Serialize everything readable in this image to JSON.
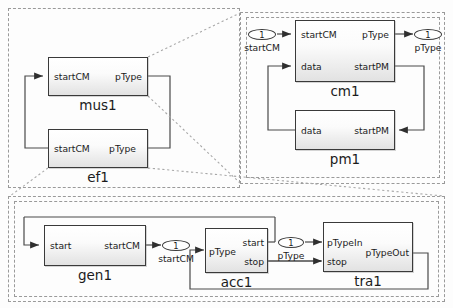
{
  "diagram": {
    "containers": [
      {
        "id": "outer-top",
        "name": "outer-top-container"
      },
      {
        "id": "detail-right",
        "name": "detail-right-container"
      },
      {
        "id": "outer-bottom",
        "name": "outer-bottom-container"
      }
    ]
  },
  "blocks": {
    "mus1": {
      "name": "mus1",
      "in_port": "startCM",
      "out_port": "pType"
    },
    "ef1": {
      "name": "ef1",
      "in_port": "startCM",
      "out_port": "pType"
    },
    "cm1": {
      "name": "cm1",
      "in_port_1": "startCM",
      "in_port_2": "data",
      "out_port_1": "pType",
      "out_port_2": "startPM"
    },
    "pm1": {
      "name": "pm1",
      "in_port_1": "data",
      "out_port_1": "startPM"
    },
    "gen1": {
      "name": "gen1",
      "in_port": "start",
      "out_port": "startCM"
    },
    "acc1": {
      "name": "acc1",
      "in_port": "pType",
      "out_port_1": "start",
      "out_port_2": "stop"
    },
    "tra1": {
      "name": "tra1",
      "in_port_1": "pTypeIn",
      "in_port_2": "stop",
      "out_port_1": "pTypeOut"
    }
  },
  "io_ports": {
    "cm_in": {
      "number": "1",
      "label": "startCM"
    },
    "cm_out": {
      "number": "1",
      "label": "pType"
    },
    "gen_out": {
      "number": "1",
      "label": "startCM"
    },
    "acc_out": {
      "number": "1",
      "label": "pType"
    }
  },
  "colors": {
    "block_border": "#3a3a3a",
    "wire": "#4a4a4a",
    "dash_border": "#9a9a9a",
    "text": "#1b1b1b",
    "block_fill_top": "#ffffff",
    "block_fill_bottom": "#e2e2e2"
  }
}
